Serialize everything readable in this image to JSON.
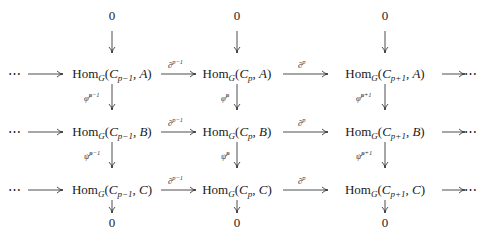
{
  "diagram": {
    "type": "commutative-diagram",
    "columns_x": [
      237,
      86,
      237,
      385
    ],
    "rows": [
      {
        "name": "top-zero",
        "y": 14,
        "nodes": [
          "0",
          "0",
          "0"
        ]
      },
      {
        "name": "row-A",
        "y": 74,
        "nodes": [
          "Hom_G(C_{p-1}, A)",
          "Hom_G(C_p, A)",
          "Hom_G(C_{p+1}, A)"
        ],
        "object": "A"
      },
      {
        "name": "row-B",
        "y": 132,
        "nodes": [
          "Hom_G(C_{p-1}, B)",
          "Hom_G(C_p, B)",
          "Hom_G(C_{p+1}, B)"
        ],
        "object": "B"
      },
      {
        "name": "row-C",
        "y": 190,
        "nodes": [
          "Hom_G(C_{p-1}, C)",
          "Hom_G(C_p, C)",
          "Hom_G(C_{p+1}, C)"
        ],
        "object": "C"
      },
      {
        "name": "bottom-zero",
        "y": 223,
        "nodes": [
          "0",
          "0",
          "0"
        ]
      }
    ],
    "ellipsis": "⋯",
    "hom": "Hom",
    "group": "G",
    "complex": "C",
    "subscripts": [
      "p−1",
      "p",
      "p+1"
    ],
    "horizontal_labels": [
      "∂",
      "∂"
    ],
    "horizontal_label_sups": [
      "p−1",
      "p"
    ],
    "vertical_labels_AB": {
      "sym": "φ̃",
      "sups": [
        "p−1",
        "p",
        "p+1"
      ]
    },
    "vertical_labels_BC": {
      "sym": "ψ̃",
      "sups": [
        "p−1",
        "p",
        "p+1"
      ]
    },
    "zero": "0"
  }
}
